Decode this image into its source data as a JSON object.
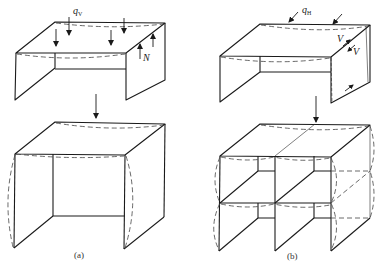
{
  "figure": {
    "panels": [
      {
        "id": "a",
        "caption": "(a)",
        "top_diagram": {
          "description": "Box slab under vertical load",
          "load_label": "q",
          "load_subscript": "V",
          "reaction_label": "N"
        },
        "bottom_diagram": {
          "description": "Deformed box (walls bowing outward)"
        }
      },
      {
        "id": "b",
        "caption": "(b)",
        "top_diagram": {
          "description": "Box slab under horizontal load",
          "load_label": "q",
          "load_subscript": "H",
          "shear_label_1": "V",
          "shear_label_2": "V"
        },
        "bottom_diagram": {
          "description": "Two-storey, two-bay box frame deformed shape"
        }
      }
    ],
    "colors": {
      "line": "#1a1a1a",
      "dashed": "#444444",
      "background": "#ffffff"
    }
  }
}
